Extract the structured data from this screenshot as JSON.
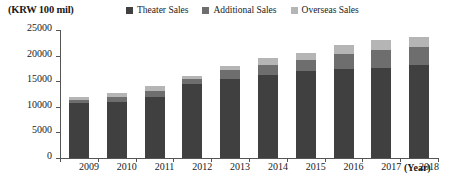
{
  "unit_label": "(KRW 100 mil)",
  "xaxis_title": "(Year)",
  "legend": {
    "position": "top",
    "items": [
      {
        "label": "Theater Sales",
        "color": "#404040"
      },
      {
        "label": "Additional Sales",
        "color": "#6e6e6e"
      },
      {
        "label": "Overseas Sales",
        "color": "#b5b5b5"
      }
    ]
  },
  "yaxis": {
    "ticks": [
      "0",
      "5000",
      "10000",
      "15000",
      "20000",
      "25000"
    ],
    "min": 0,
    "max": 25000,
    "step": 5000
  },
  "chart_data": {
    "type": "bar",
    "stacked": true,
    "title": "",
    "subtitle": "",
    "xlabel": "(Year)",
    "ylabel": "(KRW 100 mil)",
    "ylim": [
      0,
      25000
    ],
    "ytick_step": 5000,
    "grid": false,
    "legend_position": "top",
    "categories": [
      "2009",
      "2010",
      "2011",
      "2012",
      "2013",
      "2014",
      "2015",
      "2016",
      "2017",
      "2018"
    ],
    "series": [
      {
        "name": "Theater Sales",
        "color": "#404040",
        "values": [
          10700,
          11000,
          12000,
          14400,
          15500,
          16200,
          17000,
          17400,
          17600,
          18100
        ]
      },
      {
        "name": "Additional Sales",
        "color": "#6e6e6e",
        "values": [
          700,
          900,
          1100,
          1000,
          1600,
          2000,
          2200,
          2900,
          3400,
          3500
        ]
      },
      {
        "name": "Overseas Sales",
        "color": "#b5b5b5",
        "values": [
          500,
          900,
          900,
          600,
          900,
          1300,
          1300,
          1700,
          2000,
          2000
        ]
      }
    ],
    "totals": [
      11900,
      12800,
      14000,
      16000,
      18000,
      19500,
      20500,
      22000,
      23000,
      23600
    ]
  }
}
